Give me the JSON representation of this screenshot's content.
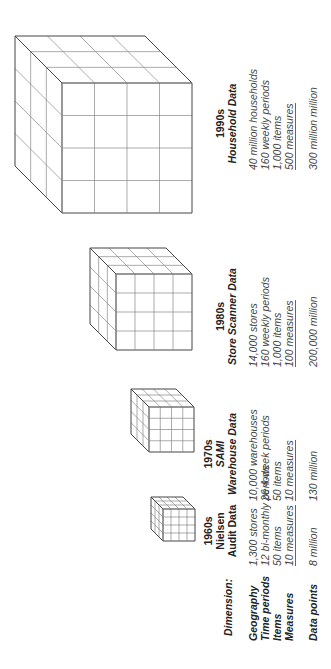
{
  "diagram": {
    "row_labels": {
      "dimension": "Dimension:",
      "geography": "Geography",
      "time_periods": "Time periods",
      "items": "Items",
      "measures": "Measures",
      "data_points": "Data points"
    },
    "columns": [
      {
        "era": "1960s",
        "title_line1": "Nielsen",
        "title_line2": "Audit Data",
        "geography": "1,300 stores",
        "time_periods": "12 bi-monthly periods",
        "items": "50 items",
        "measures": "10 measures",
        "data_points": "8 million",
        "cube_grid": 4
      },
      {
        "era": "1970s",
        "title_line1": "SAMI",
        "title_line2": "Warehouse Data",
        "geography": "10,000 warehouses",
        "time_periods": "26 4-week periods",
        "items": "50 items",
        "measures": "10 measures",
        "data_points": "130 million",
        "cube_grid": 4
      },
      {
        "era": "1980s",
        "title_line1": "Store Scanner Data",
        "geography": "14,000 stores",
        "time_periods": "160 weekly periods",
        "items": "1,000 items",
        "measures": "100 measures",
        "data_points": "200,000 million",
        "cube_grid": 4
      },
      {
        "era": "1990s",
        "title_line1": "Household Data",
        "geography": "40 million households",
        "time_periods": "160 weekly periods",
        "items": "1,000 items",
        "measures": "500 measures",
        "data_points": "300 million million",
        "cube_grid": 4
      }
    ]
  }
}
